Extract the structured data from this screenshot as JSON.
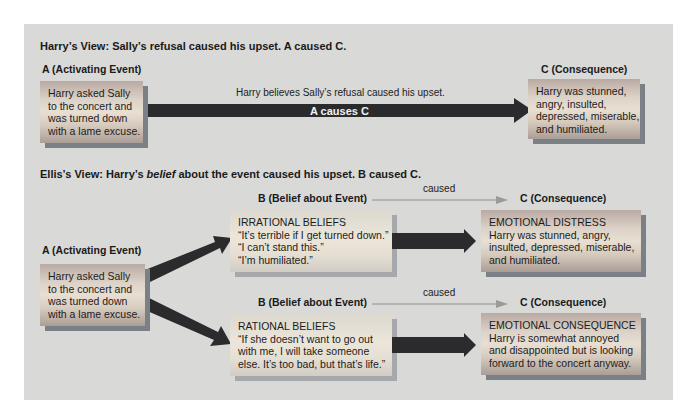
{
  "harrys_view": {
    "heading": "Harry’s View: Sally’s refusal caused his upset. A caused C.",
    "a_label": "A (Activating Event)",
    "a_box": [
      "Harry asked Sally",
      "to the concert and",
      "was turned down",
      "with a lame excuse."
    ],
    "arrow_caption": "Harry believes Sally’s refusal caused his upset.",
    "arrow_label": "A causes C",
    "c_label": "C (Consequence)",
    "c_box": [
      "Harry was stunned,",
      "angry, insulted,",
      "depressed, miserable,",
      "and humiliated."
    ]
  },
  "ellis_view": {
    "heading_pre": "Ellis’s View: Harry’s ",
    "heading_em": "belief",
    "heading_post": " about the event caused his upset. B caused C.",
    "a_label": "A (Activating Event)",
    "a_box": [
      "Harry asked Sally",
      "to the concert and",
      "was turned down",
      "with a lame excuse."
    ],
    "irrational": {
      "b_label": "B (Belief about Event)",
      "caused": "caused",
      "c_label": "C (Consequence)",
      "b_box": [
        "IRRATIONAL BELIEFS",
        "“It’s terrible if I get turned down.”",
        "“I can’t stand this.”",
        "“I’m humiliated.”"
      ],
      "c_box": [
        "EMOTIONAL DISTRESS",
        "Harry was stunned, angry,",
        "insulted, depressed, miserable,",
        "and humiliated."
      ]
    },
    "rational": {
      "b_label": "B (Belief about Event)",
      "caused": "caused",
      "c_label": "C (Consequence)",
      "b_box": [
        "RATIONAL BELIEFS",
        "“If she doesn’t want to go out",
        "with me, I will take someone",
        "else. It’s too bad, but that’s life.”"
      ],
      "c_box": [
        "EMOTIONAL CONSEQUENCE",
        "Harry is somewhat annoyed",
        "and disappointed but is looking",
        "forward to the concert anyway."
      ]
    }
  },
  "colors": {
    "panel": "#d9d9d7",
    "arrow": "#2b2b2e",
    "thin_arrow": "#8e8e8e",
    "box_shadow": "#7b7f86"
  }
}
